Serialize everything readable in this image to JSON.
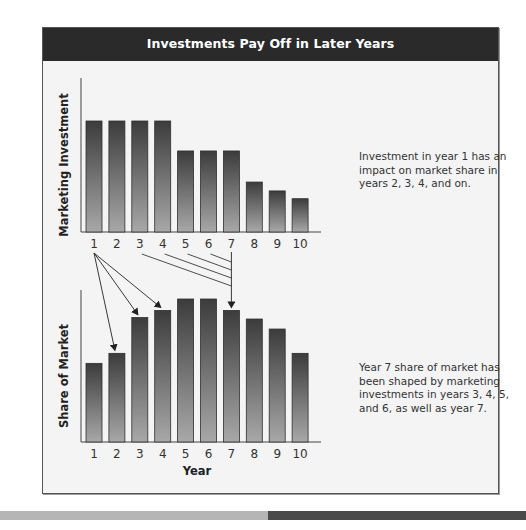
{
  "title": "Investments Pay Off in Later Years",
  "notes": {
    "top": "Investment in year 1 has an impact on market share in years 2, 3, 4, and on.",
    "bottom": "Year 7 share of market has been shaped by marketing investments in years 3, 4, 5, and 6, as well as year 7."
  },
  "colors": {
    "header_bg": "#2a2a2a",
    "bar_top": "#3c3c3c",
    "bar_bottom": "#a8a8a8",
    "footer_light": "#b5b5b5",
    "footer_dark": "#4a4a4a"
  },
  "chart_data": [
    {
      "type": "bar",
      "title": "Investments Pay Off in Later Years",
      "ylabel": "Marketing Investment",
      "xlabel": "",
      "categories": [
        "1",
        "2",
        "3",
        "4",
        "5",
        "6",
        "7",
        "8",
        "9",
        "10"
      ],
      "values": [
        100,
        100,
        100,
        100,
        73,
        73,
        73,
        45,
        37,
        30
      ],
      "value_note": "relative index, no numeric axis shown",
      "ylim": [
        0,
        100
      ],
      "grid": false
    },
    {
      "type": "bar",
      "ylabel": "Share of Market",
      "xlabel": "Year",
      "categories": [
        "1",
        "2",
        "3",
        "4",
        "5",
        "6",
        "7",
        "8",
        "9",
        "10"
      ],
      "values": [
        55,
        62,
        87,
        92,
        100,
        100,
        92,
        86,
        79,
        62
      ],
      "value_note": "relative index, no numeric axis shown",
      "ylim": [
        0,
        100
      ],
      "grid": false,
      "annotations": [
        {
          "from_year": "1",
          "to_years": [
            "2",
            "3",
            "4"
          ],
          "meaning": "Investment in year 1 impacts share in years 2, 3, 4"
        },
        {
          "from_years": [
            "3",
            "4",
            "5",
            "6",
            "7"
          ],
          "to_year": "7",
          "meaning": "Year 7 share shaped by investments in years 3-7"
        }
      ]
    }
  ]
}
